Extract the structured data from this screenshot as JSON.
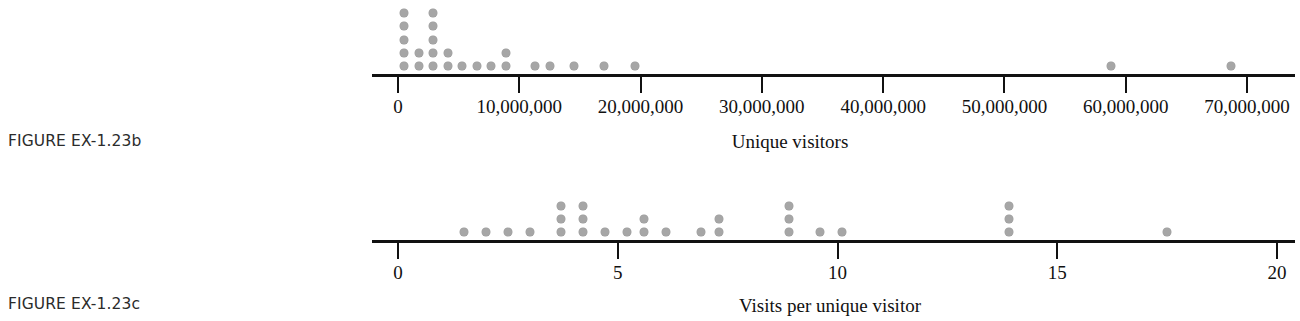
{
  "figures": [
    {
      "caption": "FIGURE EX-1.23b",
      "axis_title": "Unique visitors",
      "tick_labels": [
        "0",
        "10,000,000",
        "20,000,000",
        "30,000,000",
        "40,000,000",
        "50,000,000",
        "60,000,000",
        "70,000,000"
      ],
      "dot_color": "#a6a6a6",
      "axis_color": "#111111"
    },
    {
      "caption": "FIGURE EX-1.23c",
      "axis_title": "Visits per unique visitor",
      "tick_labels": [
        "0",
        "5",
        "10",
        "15",
        "20"
      ],
      "dot_color": "#a6a6a6",
      "axis_color": "#111111"
    }
  ],
  "chart_data": [
    {
      "type": "scatter",
      "plot_style": "dotplot",
      "title": "FIGURE EX-1.23b",
      "xlabel": "Unique visitors",
      "ylabel": "",
      "xlim": [
        0,
        72000000
      ],
      "xticks": [
        0,
        10000000,
        20000000,
        30000000,
        40000000,
        50000000,
        60000000,
        70000000
      ],
      "xtick_labels": [
        "0",
        "10,000,000",
        "20,000,000",
        "30,000,000",
        "40,000,000",
        "50,000,000",
        "60,000,000",
        "70,000,000"
      ],
      "grid": false,
      "legend": false,
      "dot_diameter_px": 8,
      "stacks": [
        {
          "x": 500000,
          "count": 5
        },
        {
          "x": 1700000,
          "count": 2
        },
        {
          "x": 2900000,
          "count": 5
        },
        {
          "x": 4100000,
          "count": 2
        },
        {
          "x": 5300000,
          "count": 1
        },
        {
          "x": 6500000,
          "count": 1
        },
        {
          "x": 7700000,
          "count": 1
        },
        {
          "x": 8900000,
          "count": 2
        },
        {
          "x": 11300000,
          "count": 1
        },
        {
          "x": 12500000,
          "count": 1
        },
        {
          "x": 14500000,
          "count": 1
        },
        {
          "x": 17000000,
          "count": 1
        },
        {
          "x": 19500000,
          "count": 1
        },
        {
          "x": 58800000,
          "count": 1
        },
        {
          "x": 68700000,
          "count": 1
        }
      ]
    },
    {
      "type": "scatter",
      "plot_style": "dotplot",
      "title": "FIGURE EX-1.23c",
      "xlabel": "Visits per unique visitor",
      "ylabel": "",
      "xlim": [
        0,
        20.5
      ],
      "xticks": [
        0,
        5,
        10,
        15,
        20
      ],
      "xtick_labels": [
        "0",
        "5",
        "10",
        "15",
        "20"
      ],
      "grid": false,
      "legend": false,
      "dot_diameter_px": 8,
      "stacks": [
        {
          "x": 1.5,
          "count": 1
        },
        {
          "x": 2.0,
          "count": 1
        },
        {
          "x": 2.5,
          "count": 1
        },
        {
          "x": 3.0,
          "count": 1
        },
        {
          "x": 3.7,
          "count": 3
        },
        {
          "x": 4.2,
          "count": 3
        },
        {
          "x": 4.7,
          "count": 1
        },
        {
          "x": 5.2,
          "count": 1
        },
        {
          "x": 5.6,
          "count": 2
        },
        {
          "x": 6.1,
          "count": 1
        },
        {
          "x": 6.9,
          "count": 1
        },
        {
          "x": 7.3,
          "count": 2
        },
        {
          "x": 8.9,
          "count": 3
        },
        {
          "x": 9.6,
          "count": 1
        },
        {
          "x": 10.1,
          "count": 1
        },
        {
          "x": 13.9,
          "count": 3
        },
        {
          "x": 17.5,
          "count": 1
        }
      ]
    }
  ]
}
